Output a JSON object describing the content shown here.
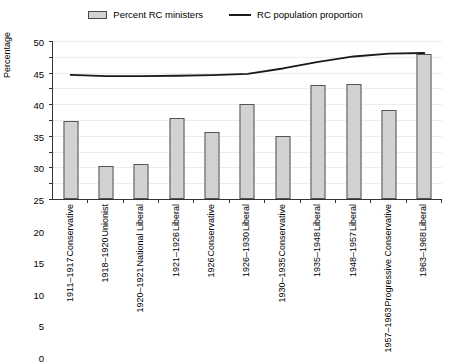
{
  "chart_data": {
    "type": "bar",
    "title": "",
    "xlabel": "",
    "ylabel": "Percentage",
    "ylim": [
      0,
      50
    ],
    "yticks": [
      0,
      5,
      10,
      15,
      20,
      25,
      30,
      35,
      40,
      45,
      50
    ],
    "grid": true,
    "legend_position": "top-center",
    "categories": [
      "1911–1917 Conservative",
      "1918–1920 Unionist",
      "1920–1921 National Liberal",
      "1921–1926 Liberal",
      "1926 Conservative",
      "1926–1930 Liberal",
      "1930–1935 Conservative",
      "1935–1948 Liberal",
      "1948–1957 Liberal",
      "1957–1963 Progressive Conservative",
      "1963–1968 Liberal"
    ],
    "category_parts": [
      {
        "period": "1911–1917",
        "party": "Conservative"
      },
      {
        "period": "1918–1920",
        "party": "Unionist"
      },
      {
        "period": "1920–1921",
        "party": "National Liberal"
      },
      {
        "period": "1921–1926",
        "party": "Liberal"
      },
      {
        "period": "1926",
        "party": "Conservative"
      },
      {
        "period": "1926–1930",
        "party": "Liberal"
      },
      {
        "period": "1930–1935",
        "party": "Conservative"
      },
      {
        "period": "1935–1948",
        "party": "Liberal"
      },
      {
        "period": "1948–1957",
        "party": "Liberal"
      },
      {
        "period": "1957–1963",
        "party": "Progressive Conservative"
      },
      {
        "period": "1963–1968",
        "party": "Liberal"
      }
    ],
    "series": [
      {
        "name": "Percent RC ministers",
        "type": "bar",
        "color": "#d2d2d2",
        "edge_color": "#555555",
        "values": [
          24.7,
          10.5,
          11.2,
          25.7,
          21.3,
          30.0,
          19.8,
          36.0,
          36.5,
          28.1,
          45.8
        ]
      },
      {
        "name": "RC population proportion",
        "type": "line",
        "color": "#1a1a1a",
        "values": [
          39.3,
          38.9,
          38.9,
          39.0,
          39.2,
          39.6,
          41.3,
          43.4,
          45.1,
          46.0,
          46.2
        ]
      }
    ]
  },
  "legend": {
    "entries": [
      {
        "label": "Percent RC ministers",
        "marker": "bar-swatch"
      },
      {
        "label": "RC population proportion",
        "marker": "line-swatch"
      }
    ]
  },
  "axes": {
    "y_title": "Percentage"
  }
}
